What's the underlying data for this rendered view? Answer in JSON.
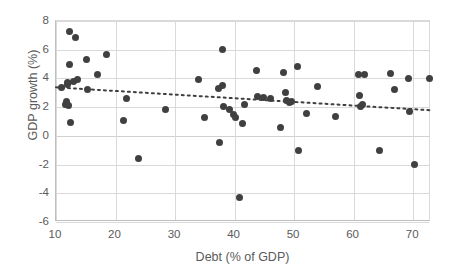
{
  "chart_data": {
    "type": "scatter",
    "title": "",
    "xlabel": "Debt (% of GDP)",
    "ylabel": "GDP growth (%)",
    "xlim": [
      10,
      73
    ],
    "ylim": [
      -6,
      8
    ],
    "xticks": [
      10,
      20,
      30,
      40,
      50,
      60,
      70
    ],
    "yticks": [
      8,
      6,
      4,
      2,
      0,
      -2,
      -4,
      -6
    ],
    "grid": true,
    "legend": "none",
    "marker_color": "#404040",
    "grid_color": "#d9d9d9",
    "axis_color": "#bfbfbf",
    "text_color": "#5a5a5a",
    "points": [
      [
        10.9,
        3.4
      ],
      [
        11.6,
        2.2
      ],
      [
        11.7,
        2.4
      ],
      [
        11.9,
        3.6
      ],
      [
        12.0,
        3.7
      ],
      [
        12.1,
        2.1
      ],
      [
        12.2,
        7.3
      ],
      [
        12.3,
        5.0
      ],
      [
        12.4,
        0.95
      ],
      [
        12.9,
        3.8
      ],
      [
        13.2,
        6.85
      ],
      [
        13.6,
        3.95
      ],
      [
        15.1,
        5.35
      ],
      [
        15.3,
        3.25
      ],
      [
        17.0,
        4.25
      ],
      [
        18.5,
        5.7
      ],
      [
        21.3,
        1.1
      ],
      [
        21.9,
        2.6
      ],
      [
        23.8,
        -1.55
      ],
      [
        28.4,
        1.85
      ],
      [
        33.9,
        3.9
      ],
      [
        34.9,
        1.25
      ],
      [
        37.3,
        3.3
      ],
      [
        37.5,
        -0.45
      ],
      [
        37.9,
        6.0
      ],
      [
        38.0,
        3.5
      ],
      [
        38.2,
        2.05
      ],
      [
        39.2,
        1.85
      ],
      [
        39.9,
        1.5
      ],
      [
        40.1,
        1.25
      ],
      [
        40.8,
        -4.3
      ],
      [
        41.3,
        0.85
      ],
      [
        41.6,
        2.15
      ],
      [
        43.6,
        4.55
      ],
      [
        43.8,
        2.75
      ],
      [
        44.9,
        2.7
      ],
      [
        46.1,
        2.6
      ],
      [
        47.7,
        0.55
      ],
      [
        48.3,
        4.4
      ],
      [
        48.5,
        3.0
      ],
      [
        48.8,
        2.45
      ],
      [
        49.3,
        2.35
      ],
      [
        49.5,
        2.4
      ],
      [
        50.5,
        4.8
      ],
      [
        50.8,
        -1.05
      ],
      [
        52.1,
        1.55
      ],
      [
        54.0,
        3.45
      ],
      [
        57.0,
        1.35
      ],
      [
        60.9,
        4.25
      ],
      [
        61.0,
        2.8
      ],
      [
        61.2,
        2.05
      ],
      [
        61.5,
        2.15
      ],
      [
        61.9,
        4.25
      ],
      [
        64.4,
        -1.05
      ],
      [
        66.2,
        4.35
      ],
      [
        66.9,
        3.2
      ],
      [
        69.3,
        4.0
      ],
      [
        69.4,
        1.7
      ],
      [
        70.3,
        -2.0
      ],
      [
        72.7,
        4.0
      ]
    ],
    "trendline": {
      "style": "dotted",
      "color": "#3f3f3f",
      "x_start": 10,
      "y_start": 3.38,
      "x_end": 73,
      "y_end": 1.78
    }
  }
}
